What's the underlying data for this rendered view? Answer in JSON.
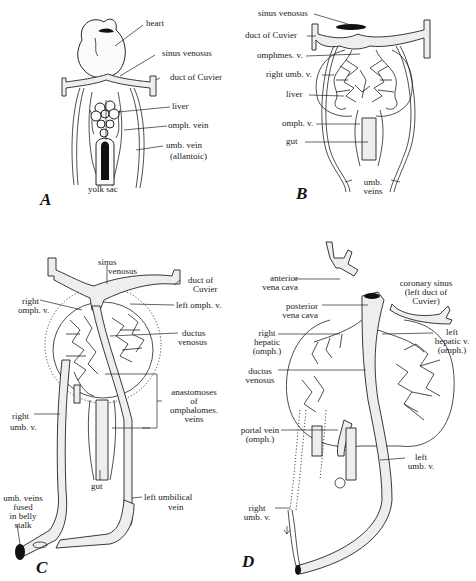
{
  "figure": {
    "panels": [
      {
        "id": "A",
        "letter": "A",
        "labels": {
          "heart": "heart",
          "sinus_venosus": "sinus venosus",
          "duct_of_cuvier": "duct of Cuvier",
          "liver": "liver",
          "omph_vein": "omph. vein",
          "umb_vein_1": "umb. vein",
          "umb_vein_2": "(allantoic)",
          "yolk_sac": "yolk sac"
        }
      },
      {
        "id": "B",
        "letter": "B",
        "labels": {
          "sinus_venosus": "sinus venosus",
          "duct_of_cuvier": "duct of Cuvier",
          "omphmes_v": "omphmes. v.",
          "right_umb_v": "right umb. v.",
          "liver": "liver",
          "omph_v": "omph. v.",
          "gut": "gut",
          "umb_veins_1": "umb.",
          "umb_veins_2": "veins"
        }
      },
      {
        "id": "C",
        "letter": "C",
        "labels": {
          "sinus_venosus_1": "sinus",
          "sinus_venosus_2": "venosus",
          "duct_of_cuvier_1": "duct of",
          "duct_of_cuvier_2": "Cuvier",
          "right_omph_v_1": "right",
          "right_omph_v_2": "omph. v.",
          "left_omph_v": "left omph. v.",
          "ductus_venosus_1": "ductus",
          "ductus_venosus_2": "venosus",
          "anastomoses_1": "anastomoses",
          "anastomoses_2": "of",
          "anastomoses_3": "omphalomes.",
          "anastomoses_4": "veins",
          "right_umb_v_1": "right",
          "right_umb_v_2": "umb. v.",
          "gut": "gut",
          "umb_veins_fused_1": "umb. veins",
          "umb_veins_fused_2": "fused",
          "umb_veins_fused_3": "in belly",
          "umb_veins_fused_4": "stalk",
          "left_umbilical_vein_1": "left umbilical",
          "left_umbilical_vein_2": "vein"
        }
      },
      {
        "id": "D",
        "letter": "D",
        "labels": {
          "anterior_vena_cava_1": "anterior",
          "anterior_vena_cava_2": "vena cava",
          "coronary_sinus_1": "coronary sinus",
          "coronary_sinus_2": "(left duct of",
          "coronary_sinus_3": "Cuvier)",
          "posterior_vena_cava_1": "posterior",
          "posterior_vena_cava_2": "vena cava",
          "right_hepatic_1": "right",
          "right_hepatic_2": "hepatic",
          "right_hepatic_3": "(omph.)",
          "left_hepatic_1": "left",
          "left_hepatic_2": "hepatic v.",
          "left_hepatic_3": "(omph.)",
          "ductus_venosus_1": "ductus",
          "ductus_venosus_2": "venosus",
          "portal_vein_1": "portal vein",
          "portal_vein_2": "(omph.)",
          "left_umb_v_1": "left",
          "left_umb_v_2": "umb. v.",
          "right_umb_v_1": "right",
          "right_umb_v_2": "umb. v."
        }
      }
    ]
  }
}
